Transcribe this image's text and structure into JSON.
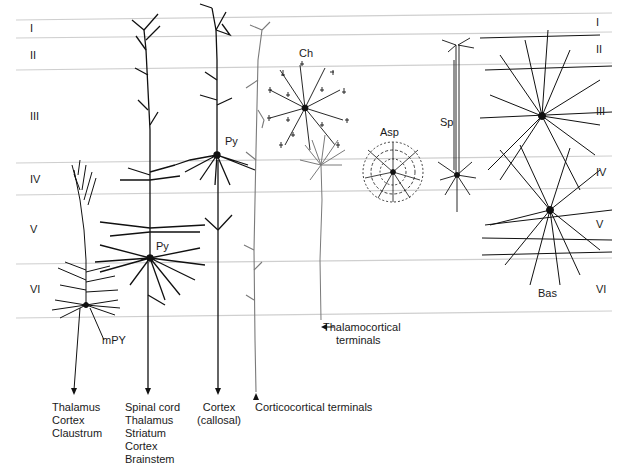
{
  "layers": {
    "left": [
      "I",
      "II",
      "III",
      "IV",
      "V",
      "VI"
    ],
    "right": [
      "I",
      "II",
      "III",
      "IV",
      "V",
      "VI"
    ]
  },
  "cells": {
    "pyramidal_upper": "Py",
    "pyramidal_lower": "Py",
    "modified_pyramidal": "mPY",
    "chandelier": "Ch",
    "aspiny_stellate": "Asp",
    "spiny_stellate": "Sp",
    "basket": "Bas"
  },
  "projections": {
    "mpy_targets": [
      "Thalamus",
      "Cortex",
      "Claustrum"
    ],
    "py_lower_targets": [
      "Spinal cord",
      "Thalamus",
      "Striatum",
      "Cortex",
      "Brainstem"
    ],
    "py_upper_targets": [
      "Cortex",
      "(callosal)"
    ],
    "corticocortical": "Corticocortical terminals",
    "thalamocortical": [
      "Thalamocortical",
      "terminals"
    ]
  },
  "colors": {
    "ink": "#111111",
    "gray_ink": "#7a7a7a",
    "layer_line": "#cfcfcf",
    "background": "#ffffff"
  }
}
